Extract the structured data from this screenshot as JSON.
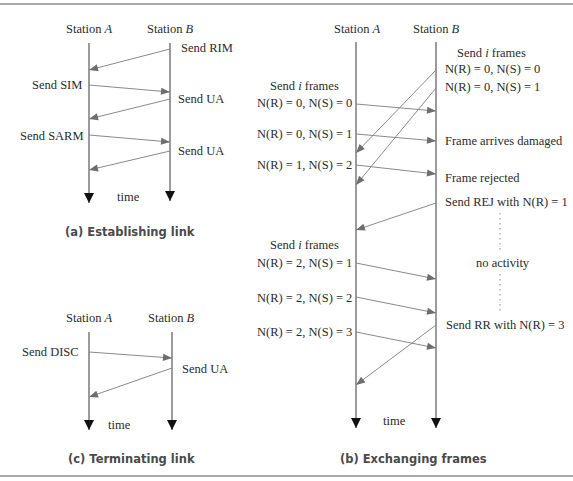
{
  "panels": {
    "a": {
      "caption": "(a) Establishing link",
      "station_a": "Station A",
      "station_b": "Station B",
      "time_label": "time",
      "messages": [
        {
          "dir": "B->A",
          "label": "Send RIM",
          "label_side": "B"
        },
        {
          "dir": "A->B",
          "label": "Send SIM",
          "label_side": "A"
        },
        {
          "dir": "B->A",
          "label": "Send UA",
          "label_side": "B"
        },
        {
          "dir": "A->B",
          "label": "Send SARM",
          "label_side": "A"
        },
        {
          "dir": "B->A",
          "label": "Send UA",
          "label_side": "B"
        }
      ]
    },
    "b": {
      "caption": "(b) Exchanging frames",
      "station_a": "Station A",
      "station_b": "Station B",
      "time_label": "time",
      "b_side": {
        "header": "Send i frames",
        "frames": [
          "N(R) = 0, N(S) = 0",
          "N(R) = 0, N(S) = 1"
        ],
        "damaged": "Frame arrives damaged",
        "rejected": "Frame rejected",
        "rej": "Send REJ with N(R) = 1",
        "no_activity": "no activity",
        "rr": "Send RR with N(R) = 3"
      },
      "a_side": {
        "header1": "Send i frames",
        "frames1": [
          "N(R) = 0, N(S) = 0",
          "N(R) = 0, N(S) = 1",
          "N(R) = 1, N(S) = 2"
        ],
        "header2": "Send i frames",
        "frames2": [
          "N(R) = 2, N(S) = 1",
          "N(R) = 2, N(S) = 2",
          "N(R) = 2, N(S) = 3"
        ]
      }
    },
    "c": {
      "caption": "(c) Terminating link",
      "station_a": "Station A",
      "station_b": "Station B",
      "time_label": "time",
      "messages": [
        {
          "dir": "A->B",
          "label": "Send DISC",
          "label_side": "A"
        },
        {
          "dir": "B->A",
          "label": "Send UA",
          "label_side": "B"
        }
      ]
    }
  },
  "colors": {
    "timeline": "#4a4a4a",
    "message": "#8a8a8a",
    "arrowhead": "#6e6e6e",
    "caption": "#4a4a4a",
    "text": "#2b2b2b"
  }
}
